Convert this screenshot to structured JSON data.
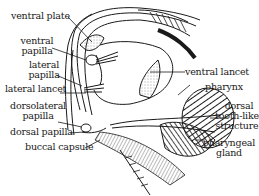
{
  "diagram": {
    "ink_color": "#1a1a1a",
    "background": "#ffffff",
    "labels": {
      "ventral_plate": "ventral plate",
      "ventral_papilla_1": "ventral",
      "ventral_papilla_2": "papilla",
      "lateral_papilla_1": "lateral",
      "lateral_papilla_2": "papilla",
      "lateral_lancet": "lateral lancet",
      "dorsolateral_papilla_1": "dorsolateral",
      "dorsolateral_papilla_2": "papilla",
      "dorsal_papilla": "dorsal papilla",
      "buccal_capsule": "buccal capsule",
      "ventral_lancet": "ventral lancet",
      "pharynx": "pharynx",
      "dorsal_tooth_1": "dorsal",
      "dorsal_tooth_2": "tooth-like",
      "dorsal_tooth_3": "structure",
      "pharyngeal_gland_1": "pharyngeal",
      "pharyngeal_gland_2": "gland"
    }
  }
}
